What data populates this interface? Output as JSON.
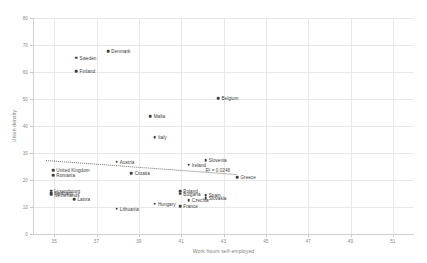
{
  "chart_data": {
    "type": "scatter",
    "title": "",
    "xlabel": "Work hours self-employed",
    "ylabel": "Union density",
    "xlim": [
      34,
      52
    ],
    "ylim": [
      0,
      80
    ],
    "xticks": [
      35,
      37,
      39,
      41,
      43,
      45,
      47,
      49,
      51
    ],
    "yticks": [
      0,
      10,
      20,
      30,
      40,
      50,
      60,
      70,
      80
    ],
    "grid": true,
    "legend": "none",
    "annotations": [
      {
        "text": "R² = 0.0248",
        "x": 42.15,
        "y": 23.2
      }
    ],
    "trendline": {
      "x0": 34.6,
      "y0": 27.4,
      "x1": 43.6,
      "y1": 22.2,
      "style": "dotted"
    },
    "points": [
      {
        "label": "Denmark",
        "x": 37.55,
        "y": 67.8,
        "label_side": "right"
      },
      {
        "label": "Sweden",
        "x": 36.05,
        "y": 65.3,
        "label_side": "right"
      },
      {
        "label": "Finland",
        "x": 36.05,
        "y": 60.2,
        "label_side": "right"
      },
      {
        "label": "Belgium",
        "x": 42.75,
        "y": 50.3,
        "label_side": "right"
      },
      {
        "label": "Malta",
        "x": 39.55,
        "y": 43.6,
        "label_side": "right"
      },
      {
        "label": "Italy",
        "x": 39.75,
        "y": 35.8,
        "label_side": "right"
      },
      {
        "label": "Austria",
        "x": 37.95,
        "y": 26.8,
        "label_side": "right"
      },
      {
        "label": "Ireland",
        "x": 41.35,
        "y": 25.6,
        "label_side": "right"
      },
      {
        "label": "Slovenia",
        "x": 42.15,
        "y": 27.3,
        "label_side": "right"
      },
      {
        "label": "Croatia",
        "x": 38.65,
        "y": 22.6,
        "label_side": "right"
      },
      {
        "label": "Greece",
        "x": 43.65,
        "y": 21.0,
        "label_side": "right"
      },
      {
        "label": "United Kingdom",
        "x": 34.95,
        "y": 23.6,
        "label_side": "right"
      },
      {
        "label": "Romania",
        "x": 34.95,
        "y": 21.8,
        "label_side": "right"
      },
      {
        "label": "Luxembourg",
        "x": 34.85,
        "y": 16.0,
        "label_side": "right"
      },
      {
        "label": "Germany",
        "x": 34.85,
        "y": 15.2,
        "label_side": "right"
      },
      {
        "label": "Netherlands",
        "x": 34.85,
        "y": 14.6,
        "label_side": "right"
      },
      {
        "label": "Poland",
        "x": 40.95,
        "y": 15.8,
        "label_side": "right"
      },
      {
        "label": "Bulgaria",
        "x": 40.95,
        "y": 15.0,
        "label_side": "right"
      },
      {
        "label": "Spain",
        "x": 42.15,
        "y": 14.4,
        "label_side": "right"
      },
      {
        "label": "Slovakia",
        "x": 42.15,
        "y": 13.2,
        "label_side": "right"
      },
      {
        "label": "Czechia",
        "x": 41.35,
        "y": 12.6,
        "label_side": "right"
      },
      {
        "label": "Latvia",
        "x": 35.95,
        "y": 12.8,
        "label_side": "right"
      },
      {
        "label": "Hungary",
        "x": 39.75,
        "y": 11.2,
        "label_side": "right"
      },
      {
        "label": "France",
        "x": 40.95,
        "y": 10.4,
        "label_side": "right"
      },
      {
        "label": "Lithuania",
        "x": 37.95,
        "y": 9.4,
        "label_side": "right"
      }
    ]
  }
}
